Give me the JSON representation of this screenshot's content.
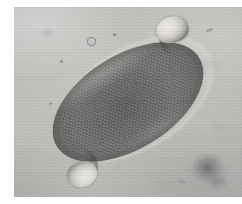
{
  "image": {
    "kind": "photomicrograph",
    "modality": "brightfield light microscopy",
    "color_mode": "grayscale",
    "width_px": 242,
    "height_px": 204,
    "caption": "",
    "subject": "Trichuris trichiura egg",
    "subject_common_name": "whipworm egg",
    "description": "Barrel-shaped (football/lemon-shaped) helminth egg with a thick smooth shell and a translucent mucoid polar plug at each end, lying diagonally on a pale gray field."
  },
  "frame": {
    "margin_color": "#ffffff",
    "left_margin_px": 14,
    "top_margin_px": 7,
    "bottom_margin_px": 7,
    "photo_width_px": 228,
    "photo_height_px": 190
  },
  "field": {
    "name": "background-field",
    "base_color": "#bcbcb9",
    "light_color": "#c6c6c3",
    "dark_color": "#a9a9a7",
    "grain": "film-grain",
    "illumination": "uneven, brighter upper-left"
  },
  "specimen": {
    "name": "trichuris-egg",
    "shape": "barrel",
    "tilt_degrees": -32,
    "long_axis_px": 168,
    "short_axis_px": 94,
    "shell": {
      "name": "egg-shell-wall",
      "outer_rim_color": "#3a3a38",
      "body_color": "#6b6b69",
      "inner_refractile_line_color": "#b2b2ae"
    },
    "contents": {
      "name": "unsegmented-ovum",
      "color": "#6e6e6c",
      "texture": "granular"
    },
    "plugs": [
      {
        "name": "polar-plug-upper-right",
        "position": "upper-right pole",
        "color": "#e6e4dd",
        "width_px": 32,
        "height_px": 26
      },
      {
        "name": "polar-plug-lower-left",
        "position": "lower-left pole",
        "color": "#e3e1da",
        "width_px": 30,
        "height_px": 25
      }
    ]
  },
  "artifacts": {
    "smudge": {
      "name": "debris-smudge",
      "position": "lower-right",
      "color": "#5c5c5a",
      "focus": "out-of-focus"
    },
    "specks": [
      {
        "name": "speck-ring-upper-left",
        "x": 76,
        "y": 33,
        "size_px": 6,
        "color": "#8d8d8b",
        "style": "ring"
      },
      {
        "name": "speck-upper-left-a",
        "x": 100,
        "y": 27,
        "size_px": 3,
        "color": "#8a8a88",
        "style": "dot"
      },
      {
        "name": "speck-upper-left-b",
        "x": 47,
        "y": 54,
        "size_px": 3,
        "color": "#90908e",
        "style": "dot"
      },
      {
        "name": "speck-upper-right-a",
        "x": 196,
        "y": 24,
        "size_px": 4,
        "color": "#949492",
        "style": "dash"
      },
      {
        "name": "speck-mid-left",
        "x": 36,
        "y": 96,
        "size_px": 3,
        "color": "#969694",
        "style": "dot"
      },
      {
        "name": "speck-lower-mid",
        "x": 168,
        "y": 176,
        "size_px": 4,
        "color": "#9a9a98",
        "style": "dash"
      },
      {
        "name": "speck-lower-left",
        "x": 58,
        "y": 162,
        "size_px": 3,
        "color": "#98989 6",
        "style": "dot"
      }
    ]
  }
}
